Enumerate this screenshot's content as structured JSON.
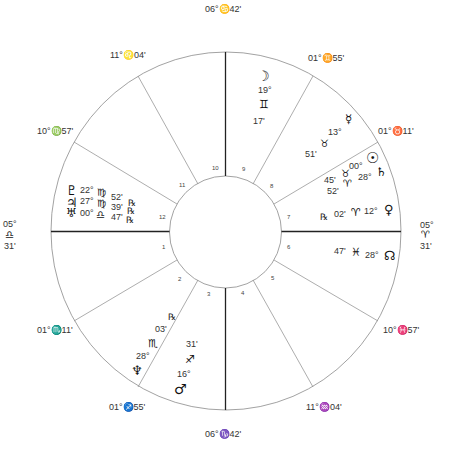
{
  "chart_info": {
    "type": "natal-chart-wheel",
    "houses_count": 12
  },
  "cusps": {
    "mc": {
      "deg": "06°",
      "sign": "♋",
      "min": "42'",
      "label": "06°♋42'"
    },
    "h11": {
      "label_deg": "11°",
      "sign": "♌",
      "min": "04'"
    },
    "h12": {
      "label_deg": "10°",
      "sign": "♍",
      "min": "57'"
    },
    "asc": {
      "deg": "05°",
      "sign": "♎",
      "min": "31'"
    },
    "h2": {
      "label_deg": "01°",
      "sign": "♏",
      "min": "11'"
    },
    "h3": {
      "label_deg": "01°",
      "sign": "♐",
      "min": "55'"
    },
    "ic": {
      "deg": "06°",
      "sign": "♑",
      "min": "42'"
    },
    "h5": {
      "label_deg": "11°",
      "sign": "♒",
      "min": "04'"
    },
    "h6": {
      "label_deg": "10°",
      "sign": "♓",
      "min": "57'"
    },
    "dsc": {
      "deg": "05°",
      "sign": "♈",
      "min": "31'"
    },
    "h8": {
      "label_deg": "01°",
      "sign": "♉",
      "min": "11'"
    },
    "h9": {
      "label_deg": "01°",
      "sign": "♊",
      "min": "55'"
    }
  },
  "cusp_labels": {
    "mc": "06°♋42'",
    "h11": "11°♌04'",
    "h12": "10°♍57'",
    "h2": "01°♏11'",
    "h3": "01°♐55'",
    "ic": "06°♑42'",
    "h5": "11°♒04'",
    "h6": "10°♓57'",
    "h8": "01°♉11'",
    "h9": "01°♊55'",
    "asc_deg": "05°",
    "asc_sign": "♎",
    "asc_min": "31'",
    "dsc_deg": "05°",
    "dsc_sign": "♈",
    "dsc_min": "31'"
  },
  "house_numbers": [
    "1",
    "2",
    "3",
    "4",
    "5",
    "6",
    "7",
    "8",
    "9",
    "10",
    "11",
    "12"
  ],
  "planets": {
    "moon": {
      "glyph": "☽",
      "deg": "19°",
      "sign": "♊",
      "min": "17'",
      "house": "9"
    },
    "mercury": {
      "glyph": "☿",
      "deg": "13°",
      "sign": "♉",
      "min": "51'",
      "house": "8"
    },
    "sun": {
      "glyph": "☉",
      "deg": "00°",
      "sign": "♉",
      "min": "45'",
      "house": "8"
    },
    "saturn": {
      "glyph": "♄",
      "deg": "28°",
      "sign": "♈",
      "min": "52'",
      "house": "8"
    },
    "venus": {
      "glyph": "♀",
      "deg": "12°",
      "sign": "♈",
      "min": "02'",
      "retro": "℞",
      "house": "7"
    },
    "node": {
      "glyph": "☊",
      "deg": "28°",
      "sign": "♓",
      "min": "47'",
      "house": "6"
    },
    "pluto": {
      "glyph": "♇",
      "deg": "22°",
      "sign": "♍",
      "min": "52'",
      "retro": "℞",
      "house": "12"
    },
    "jupiter": {
      "glyph": "♃",
      "deg": "27°",
      "sign": "♍",
      "min": "39'",
      "retro": "℞",
      "house": "12"
    },
    "uranus": {
      "glyph": "♅",
      "deg": "00°",
      "sign": "♎",
      "min": "47'",
      "retro": "℞",
      "house": "12"
    },
    "neptune": {
      "glyph": "♆",
      "deg": "28°",
      "sign": "♏",
      "min": "03'",
      "retro": "℞",
      "house": "2"
    },
    "mars": {
      "glyph": "♂",
      "deg": "16°",
      "sign": "♐",
      "min": "31'",
      "house": "3"
    }
  },
  "colors": {
    "line": "#8a8a8a",
    "axis": "#222222",
    "text": "#222222",
    "bg": "#ffffff"
  }
}
